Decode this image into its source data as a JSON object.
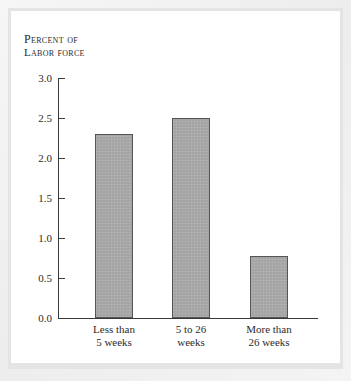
{
  "chart_data": {
    "type": "bar",
    "title": "",
    "subtitle": "",
    "axis_caption_line1": "Percent of",
    "axis_caption_line2": "Labor force",
    "xlabel": "",
    "ylabel": "Percent of labor force",
    "categories": [
      "Less than 5 weeks",
      "5 to 26 weeks",
      "More than 26 weeks"
    ],
    "category_lines": [
      [
        "Less than",
        "5 weeks"
      ],
      [
        "5 to 26",
        "weeks"
      ],
      [
        "More than",
        "26 weeks"
      ]
    ],
    "values": [
      2.3,
      2.5,
      0.78
    ],
    "ylim": [
      0.0,
      3.0
    ],
    "ytick_values": [
      3.0,
      2.5,
      2.0,
      1.5,
      1.0,
      0.5,
      0.0
    ],
    "ytick_labels": [
      "3.0",
      "2.5",
      "2.0",
      "1.5",
      "1.0",
      "0.5",
      "0.0"
    ],
    "grid": false,
    "legend": false,
    "legend_position": "none",
    "bar_fill_color": "#a9a9a9",
    "bar_border_color": "#555555",
    "axis_color": "#3a3a3a",
    "text_color": "#2b2b2b",
    "panel_background": "#ffffff",
    "frame_background": "#ededed"
  }
}
